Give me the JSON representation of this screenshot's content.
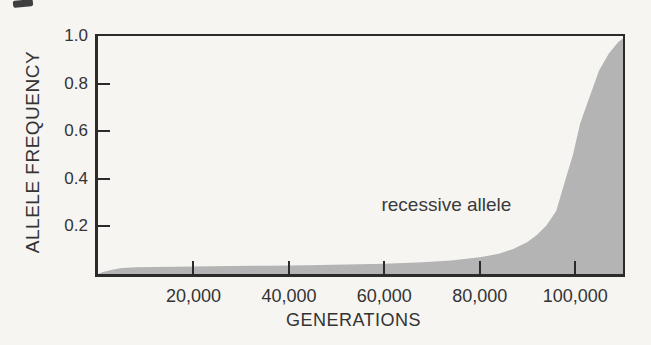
{
  "figure": {
    "background_color": "#f6f5f2",
    "artifact_mark": "small dark print smudge, top-left corner"
  },
  "chart_data": {
    "type": "area",
    "title": "",
    "xlabel": "GENERATIONS",
    "ylabel": "ALLELE FREQUENCY",
    "annotation": {
      "text": "recessive allele",
      "x": 73000,
      "y": 0.29
    },
    "xlim": [
      0,
      110000
    ],
    "ylim": [
      0,
      1.0
    ],
    "grid": false,
    "legend": "none",
    "axis_color": "#2b2b2b",
    "text_color": "#333333",
    "x_ticks": [
      {
        "value": 20000,
        "label": "20,000",
        "mark": true
      },
      {
        "value": 40000,
        "label": "40,000",
        "mark": true
      },
      {
        "value": 60000,
        "label": "60,000",
        "mark": true
      },
      {
        "value": 80000,
        "label": "80,000",
        "mark": true
      },
      {
        "value": 100000,
        "label": "100,000",
        "mark": true
      }
    ],
    "y_ticks": [
      {
        "value": 1.0,
        "label": "1.0",
        "mark": false
      },
      {
        "value": 0.8,
        "label": "0.8",
        "mark": true
      },
      {
        "value": 0.6,
        "label": "0.6",
        "mark": true
      },
      {
        "value": 0.4,
        "label": "0.4",
        "mark": true
      },
      {
        "value": 0.2,
        "label": "0.2",
        "mark": true
      }
    ],
    "series": [
      {
        "name": "recessive allele",
        "fill_color": "#b4b4b4",
        "x": [
          0,
          1000,
          3000,
          5000,
          8000,
          12000,
          20000,
          28000,
          36000,
          44000,
          52000,
          60000,
          68000,
          74000,
          80000,
          84000,
          87000,
          90000,
          92000,
          94000,
          96000,
          98000,
          99500,
          101000,
          103000,
          105000,
          107000,
          109000,
          110000
        ],
        "y": [
          0,
          0.008,
          0.018,
          0.025,
          0.028,
          0.03,
          0.032,
          0.033,
          0.035,
          0.037,
          0.04,
          0.043,
          0.049,
          0.057,
          0.07,
          0.085,
          0.105,
          0.135,
          0.165,
          0.205,
          0.265,
          0.4,
          0.5,
          0.63,
          0.745,
          0.855,
          0.925,
          0.975,
          0.99
        ]
      }
    ]
  }
}
